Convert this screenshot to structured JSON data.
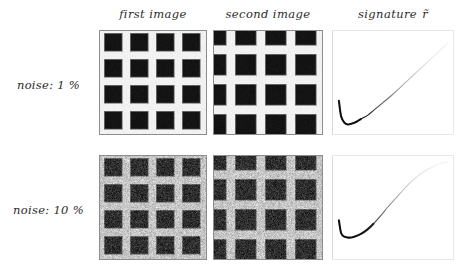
{
  "figure": {
    "caption_present": false,
    "background_color": "#ffffff",
    "column_headers": [
      {
        "id": "first-image",
        "label": "first image"
      },
      {
        "id": "second-image",
        "label": "second image"
      },
      {
        "id": "signature",
        "label": "signature ",
        "symbol": "r̃"
      }
    ],
    "row_labels": [
      {
        "id": "noise-1",
        "label": "noise: 1 %",
        "noise_percent": 1
      },
      {
        "id": "noise-10",
        "label": "noise: 10 %",
        "noise_percent": 10
      }
    ],
    "colors": {
      "ink": "#1a1a1a",
      "label_text": "#2b2b2b",
      "panel_border": "#8d8d8d",
      "plot_border": "#e8e8e8",
      "dark_square": "#141414",
      "light_background": "#f2f2f2",
      "curve": "#111111"
    }
  },
  "panels": {
    "image_grid": {
      "pattern": "checkerboard of dark squares on light background",
      "squares_per_row": 4,
      "squares_per_col": 4,
      "first_image": {
        "square_size_px": 18,
        "period_px": 26,
        "offset_x_px": 4,
        "offset_y_px": 2
      },
      "second_image": {
        "square_size_px": 21,
        "period_px": 30,
        "offset_x_px": -9,
        "offset_y_px": -7,
        "note": "translated and slightly magnified version of first image"
      },
      "noise_levels": {
        "row_0_sigma_percent": 1,
        "row_1_sigma_percent": 10
      },
      "levels": {
        "dark_value": 0.08,
        "light_value": 0.95,
        "light_value_noisy": 0.78
      }
    }
  },
  "chart_data": [
    {
      "id": "signature-noise-1",
      "type": "line",
      "title": "signature r̃",
      "row": "noise: 1 %",
      "xlabel": "",
      "ylabel": "",
      "xlim": [
        0,
        1
      ],
      "ylim": [
        0,
        1
      ],
      "grid": false,
      "legend": false,
      "series": [
        {
          "name": "r-bar",
          "x": [
            0.0,
            0.02,
            0.05,
            0.08,
            0.12,
            0.16,
            0.2,
            0.26,
            0.32,
            0.4,
            0.48,
            0.56,
            0.64,
            0.72,
            0.8,
            0.88,
            0.96,
            1.0
          ],
          "y": [
            0.3,
            0.13,
            0.06,
            0.04,
            0.05,
            0.07,
            0.1,
            0.14,
            0.2,
            0.28,
            0.36,
            0.45,
            0.54,
            0.63,
            0.72,
            0.81,
            0.9,
            0.94
          ],
          "note": "sharp drop to a minimum near x=0.08 then smooth monotone rise; line darkest at the minimum and fading toward the upper right"
        }
      ]
    },
    {
      "id": "signature-noise-10",
      "type": "line",
      "title": "signature r̃",
      "row": "noise: 10 %",
      "xlabel": "",
      "ylabel": "",
      "xlim": [
        0,
        1
      ],
      "ylim": [
        0,
        1
      ],
      "grid": false,
      "legend": false,
      "series": [
        {
          "name": "r-bar",
          "x": [
            0.0,
            0.02,
            0.05,
            0.09,
            0.14,
            0.2,
            0.26,
            0.32,
            0.38,
            0.44,
            0.5,
            0.56,
            0.62,
            0.7,
            0.78,
            0.86,
            0.94,
            1.0
          ],
          "y": [
            0.36,
            0.22,
            0.18,
            0.17,
            0.18,
            0.21,
            0.26,
            0.33,
            0.41,
            0.5,
            0.58,
            0.66,
            0.74,
            0.83,
            0.9,
            0.95,
            0.99,
            1.0
          ],
          "note": "shallow bump near x=0.10 forming a broad local plateau, descending to a minimum near x=0.50 then a steep nearly linear rise"
        }
      ]
    }
  ]
}
